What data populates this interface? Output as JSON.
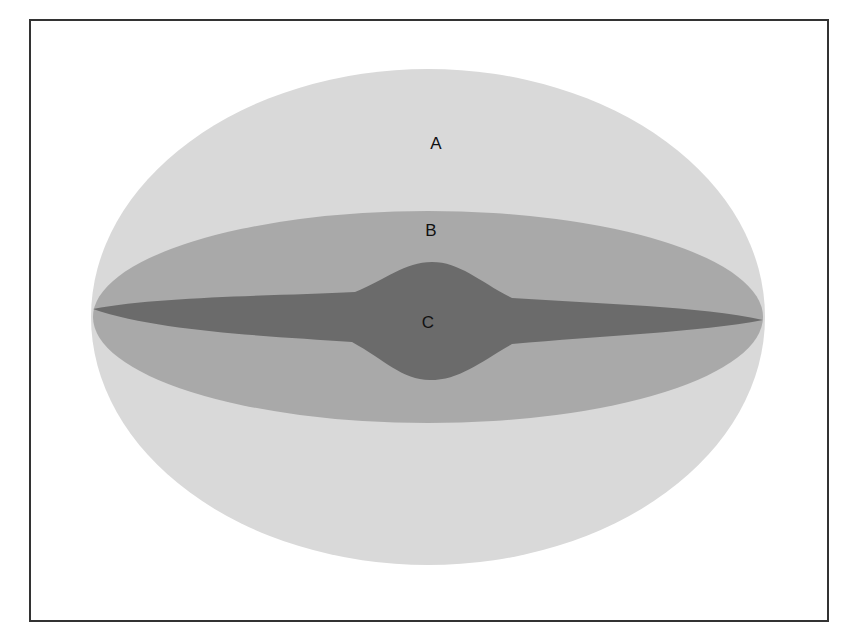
{
  "diagram": {
    "regions": [
      {
        "id": "A",
        "label": "A",
        "shape": "large-ellipse",
        "color": "#d9d9d9",
        "label_pos": [
          436,
          144
        ]
      },
      {
        "id": "B",
        "label": "B",
        "shape": "flattened-ellipse",
        "color": "#a9a9a9",
        "label_pos": [
          431,
          231
        ]
      },
      {
        "id": "C",
        "label": "C",
        "shape": "thin-disk-with-central-bulge",
        "color": "#6b6b6b",
        "label_pos": [
          428,
          323
        ]
      }
    ],
    "frame_color": "#333333"
  }
}
